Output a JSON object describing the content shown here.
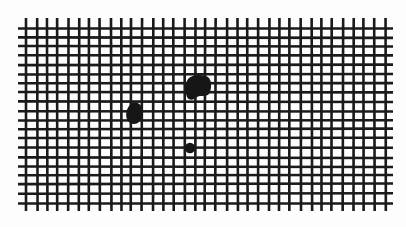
{
  "image": {
    "subject": "Amsler grid with distortion spots",
    "background_color": "#fdfdfd",
    "line_color": "#1a1a1a",
    "blot_color": "#161616"
  },
  "grid": {
    "x_start": 26,
    "x_end": 385,
    "y_start": 28,
    "y_end": 203,
    "columns": 34,
    "rows": 19,
    "line_width": 2.6,
    "overhang": 4
  },
  "blots": [
    {
      "name": "left-blot",
      "cx": 134,
      "cy": 113,
      "rx": 8,
      "ry": 10
    },
    {
      "name": "top-blot",
      "cx": 198,
      "cy": 88,
      "rx": 12,
      "ry": 12
    },
    {
      "name": "small-dot",
      "cx": 190,
      "cy": 148,
      "rx": 5,
      "ry": 5
    }
  ]
}
